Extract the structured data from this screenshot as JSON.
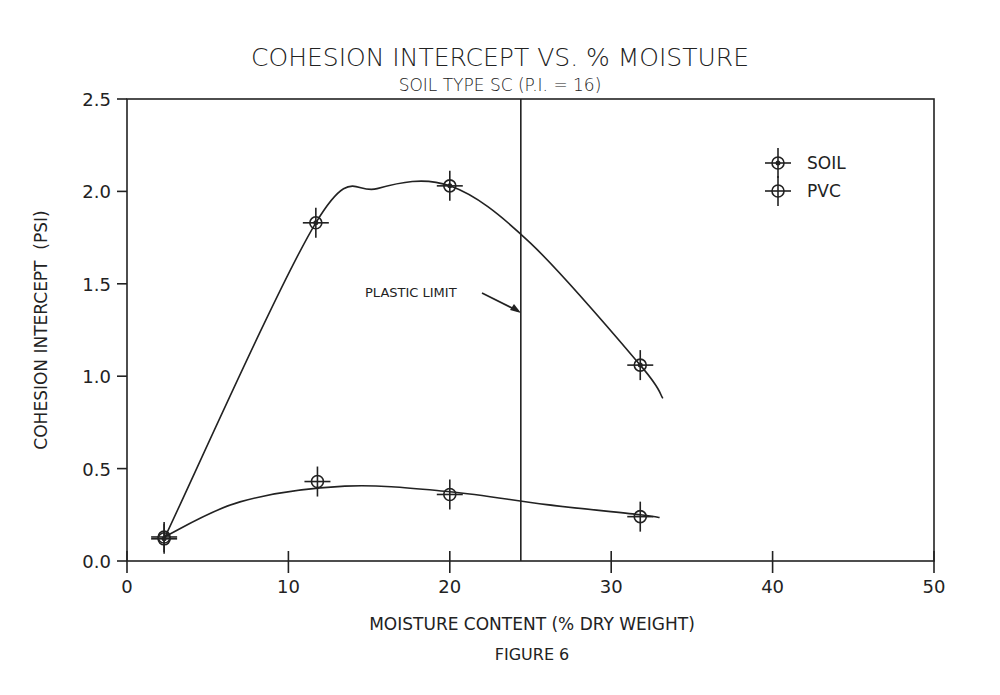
{
  "chart_data": {
    "type": "line",
    "title": "COHESION INTERCEPT VS. % MOISTURE",
    "subtitle": "SOIL TYPE SC (P.I. = 16)",
    "xlabel": "MOISTURE CONTENT (% DRY WEIGHT)",
    "ylabel": "COHESION INTERCEPT  (PSI)",
    "caption": "FIGURE 6",
    "xlim": [
      0,
      50
    ],
    "ylim": [
      0.0,
      2.5
    ],
    "x_ticks": [
      "0",
      "10",
      "20",
      "30",
      "40",
      "50"
    ],
    "y_ticks": [
      "0.0",
      "0.5",
      "1.0",
      "1.5",
      "2.0",
      "2.5"
    ],
    "grid": false,
    "legend_position": "upper right",
    "series": [
      {
        "name": "SOIL",
        "marker": "circle-cross-filled",
        "x": [
          2.3,
          11.7,
          20.0,
          31.8
        ],
        "y": [
          0.12,
          1.83,
          2.03,
          1.06
        ]
      },
      {
        "name": "PVC",
        "marker": "circle-cross",
        "x": [
          2.3,
          11.8,
          20.0,
          31.8
        ],
        "y": [
          0.13,
          0.43,
          0.36,
          0.24
        ]
      }
    ],
    "annotations": [
      {
        "type": "vertical-line",
        "x": 24.4,
        "label": "PLASTIC LIMIT"
      }
    ]
  }
}
